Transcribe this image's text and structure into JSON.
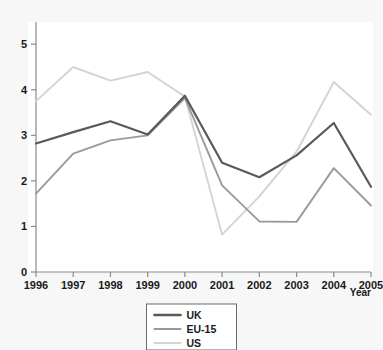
{
  "chart_data": {
    "type": "line",
    "title": "",
    "xlabel": "Year",
    "ylabel": "",
    "categories": [
      "1996",
      "1997",
      "1998",
      "1999",
      "2000",
      "2001",
      "2002",
      "2003",
      "2004",
      "2005"
    ],
    "x": [
      1996,
      1997,
      1998,
      1999,
      2000,
      2001,
      2002,
      2003,
      2004,
      2005
    ],
    "xlim": [
      1996,
      2005
    ],
    "ylim": [
      0,
      5.4
    ],
    "yticks": [
      0,
      1,
      2,
      3,
      4,
      5
    ],
    "ytick_labels": [
      "0",
      "1",
      "2",
      "3",
      "4",
      "5"
    ],
    "grid": false,
    "legend_position": "bottom-center",
    "series": [
      {
        "name": "UK",
        "color": "#595959",
        "values": [
          2.82,
          3.07,
          3.31,
          3.02,
          3.87,
          2.4,
          2.08,
          2.56,
          3.27,
          1.87
        ]
      },
      {
        "name": "EU-15",
        "color": "#9a9a9a",
        "values": [
          1.72,
          2.6,
          2.89,
          3.0,
          3.82,
          1.9,
          1.11,
          1.1,
          2.28,
          1.46
        ]
      },
      {
        "name": "US",
        "color": "#d4d4d4",
        "values": [
          3.75,
          4.5,
          4.2,
          4.39,
          3.85,
          0.82,
          1.66,
          2.64,
          4.17,
          3.45
        ]
      }
    ]
  },
  "axes": {
    "x_axis_title": "Year",
    "y_axis_title": ""
  },
  "legend": {
    "items": [
      {
        "label": "UK",
        "color": "#595959"
      },
      {
        "label": "EU-15",
        "color": "#9a9a9a"
      },
      {
        "label": "US",
        "color": "#d4d4d4"
      }
    ]
  }
}
